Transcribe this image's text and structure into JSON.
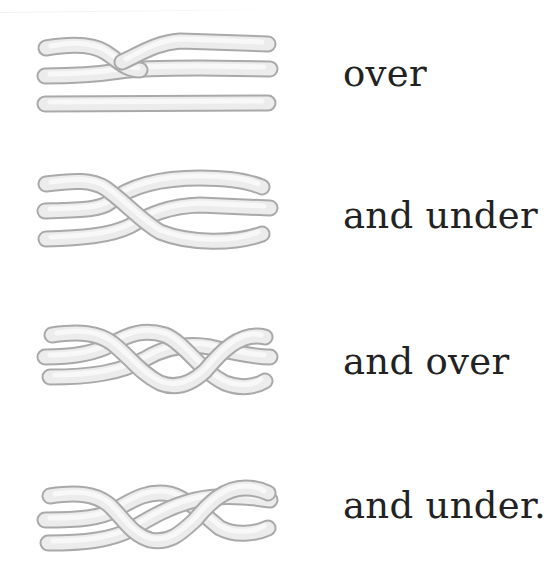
{
  "page": {
    "background": "#ffffff",
    "text_color": "#222222",
    "strand_fill_color": "#ececec",
    "strand_outline_color": "#a9a9a9"
  },
  "steps": [
    {
      "label": "over",
      "illustration": "braid-step-1-over"
    },
    {
      "label": "and under",
      "illustration": "braid-step-2-under"
    },
    {
      "label": "and over",
      "illustration": "braid-step-3-over"
    },
    {
      "label": "and under.",
      "illustration": "braid-step-4-under"
    }
  ]
}
